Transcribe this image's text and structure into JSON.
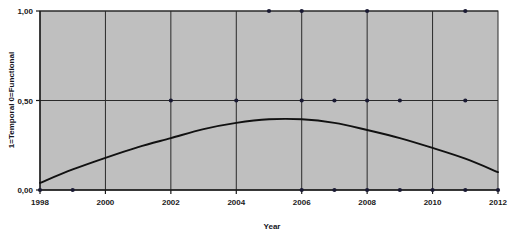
{
  "chart_data": {
    "type": "scatter",
    "title": "",
    "subtitle": "",
    "xlabel": "Year",
    "ylabel": "1=Temporal 0=Functional",
    "xlim": [
      1998,
      2012
    ],
    "ylim": [
      0.0,
      1.0
    ],
    "xticks": [
      1998,
      2000,
      2002,
      2004,
      2006,
      2008,
      2010,
      2012
    ],
    "xticklabels": [
      "1998",
      "2000",
      "2002",
      "2004",
      "2006",
      "2008",
      "2010",
      "2012"
    ],
    "yticks": [
      0.0,
      0.5,
      1.0
    ],
    "yticklabels": [
      "0,00",
      "0,50",
      "1,00"
    ],
    "grid": "vertical gridlines at every labeled even year; horizontal gridlines at 0,50 and 1,00",
    "legend": "none",
    "plot_background": "#bfbfbf",
    "marker_color": "#1a1a33",
    "curve_color": "#111111",
    "series": [
      {
        "name": "observations",
        "type": "scatter",
        "points": [
          {
            "x": 1998,
            "y": 0.0
          },
          {
            "x": 1999,
            "y": 0.0
          },
          {
            "x": 2002,
            "y": 0.5
          },
          {
            "x": 2004,
            "y": 0.5
          },
          {
            "x": 2005,
            "y": 1.0
          },
          {
            "x": 2006,
            "y": 1.0
          },
          {
            "x": 2006,
            "y": 0.5
          },
          {
            "x": 2006,
            "y": 0.0
          },
          {
            "x": 2007,
            "y": 0.5
          },
          {
            "x": 2007,
            "y": 0.0
          },
          {
            "x": 2008,
            "y": 1.0
          },
          {
            "x": 2008,
            "y": 0.5
          },
          {
            "x": 2008,
            "y": 0.0
          },
          {
            "x": 2009,
            "y": 0.5
          },
          {
            "x": 2009,
            "y": 0.0
          },
          {
            "x": 2010,
            "y": 0.0
          },
          {
            "x": 2011,
            "y": 1.0
          },
          {
            "x": 2011,
            "y": 0.5
          },
          {
            "x": 2011,
            "y": 0.0
          },
          {
            "x": 2012,
            "y": 0.0
          }
        ]
      },
      {
        "name": "quadratic-fit",
        "type": "line",
        "points": [
          {
            "x": 1998,
            "y": 0.04
          },
          {
            "x": 1999,
            "y": 0.115
          },
          {
            "x": 2000,
            "y": 0.18
          },
          {
            "x": 2001,
            "y": 0.24
          },
          {
            "x": 2002,
            "y": 0.29
          },
          {
            "x": 2003,
            "y": 0.34
          },
          {
            "x": 2004,
            "y": 0.375
          },
          {
            "x": 2005,
            "y": 0.395
          },
          {
            "x": 2006,
            "y": 0.395
          },
          {
            "x": 2007,
            "y": 0.375
          },
          {
            "x": 2008,
            "y": 0.335
          },
          {
            "x": 2009,
            "y": 0.29
          },
          {
            "x": 2010,
            "y": 0.235
          },
          {
            "x": 2011,
            "y": 0.175
          },
          {
            "x": 2012,
            "y": 0.1
          }
        ]
      }
    ]
  }
}
